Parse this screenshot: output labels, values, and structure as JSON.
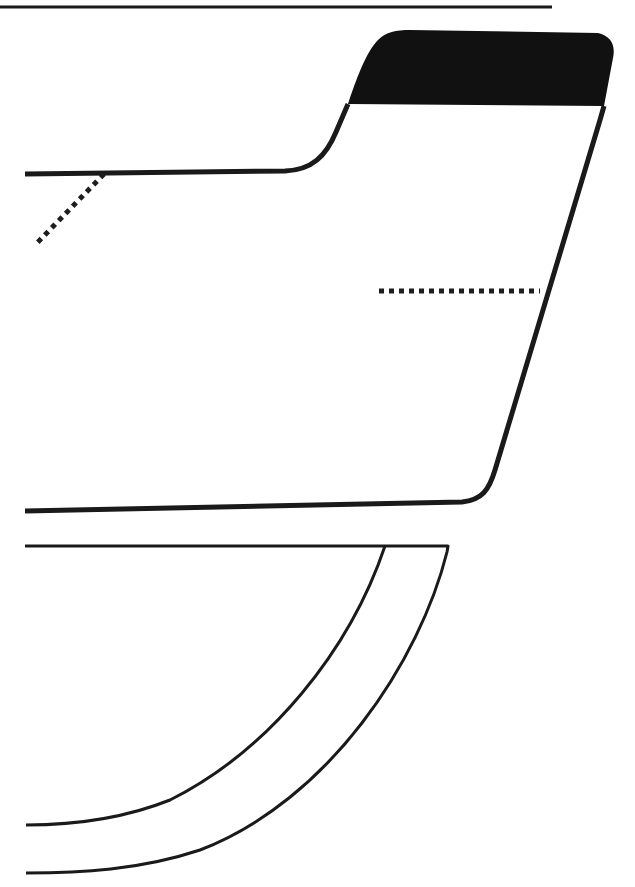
{
  "figure": {
    "type": "technical line drawing",
    "colors": {
      "line": "#1a1a1a",
      "tab_fill": "#111111",
      "background": "#ffffff"
    },
    "labels": []
  }
}
